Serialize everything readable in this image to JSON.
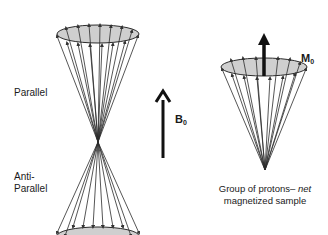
{
  "labels": {
    "parallel": "Parallel",
    "anti_parallel_line1": "Anti-",
    "anti_parallel_line2": "Parallel",
    "field": {
      "main": "B",
      "sub": "0"
    },
    "magnetization": {
      "main": "M",
      "sub": "0"
    }
  },
  "caption": {
    "line1_prefix": "Group of protons– ",
    "line1_italic": "net",
    "line2": "magnetized sample"
  },
  "colors": {
    "line": "#2b2b2b",
    "ellipse_fill": "#cfcfcf",
    "arrow": "#111111"
  }
}
